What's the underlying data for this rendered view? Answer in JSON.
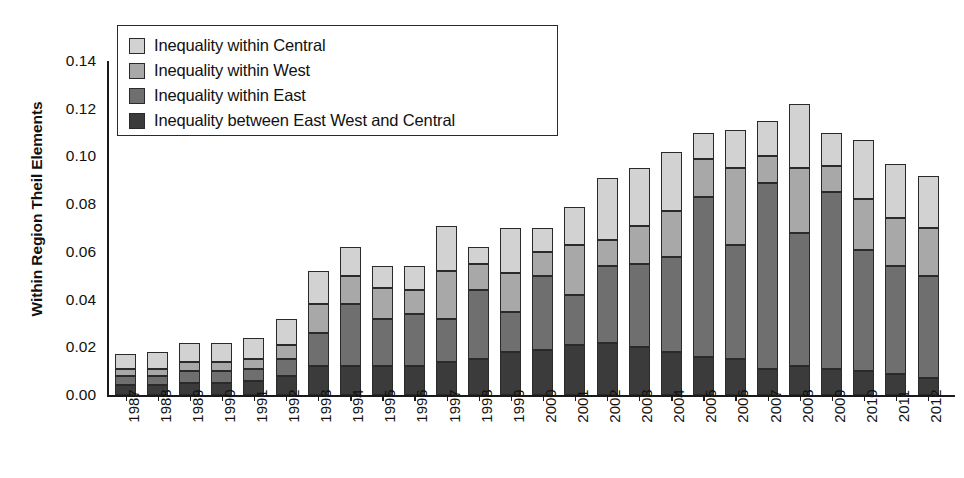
{
  "chart_data": {
    "type": "bar",
    "subtype": "stacked-bar",
    "title": "",
    "xlabel": "",
    "ylabel": "Within Region Theil Elements",
    "ylim": [
      0.0,
      0.14
    ],
    "ytick_labels": [
      "0.00",
      "0.02",
      "0.04",
      "0.06",
      "0.08",
      "0.10",
      "0.12",
      "0.14"
    ],
    "ytick_values": [
      0.0,
      0.02,
      0.04,
      0.06,
      0.08,
      0.1,
      0.12,
      0.14
    ],
    "grid": false,
    "legend_position": "top-left-inside",
    "stack_order_bottom_to_top": [
      "Inequality between East West and Central",
      "Inequality within East",
      "Inequality within West",
      "Inequality within Central"
    ],
    "categories": [
      "1987",
      "1988",
      "1989",
      "1990",
      "1991",
      "1992",
      "1993",
      "1994",
      "1995",
      "1996",
      "1997",
      "1998",
      "1999",
      "2000",
      "2001",
      "2002",
      "2003",
      "2004",
      "2005",
      "2006",
      "2007",
      "2008",
      "2009",
      "2010",
      "2011",
      "2012"
    ],
    "series": [
      {
        "name": "Inequality between East West and Central",
        "color": "#3b3b3b",
        "values": [
          0.004,
          0.004,
          0.005,
          0.005,
          0.006,
          0.008,
          0.012,
          0.012,
          0.012,
          0.012,
          0.014,
          0.015,
          0.018,
          0.019,
          0.021,
          0.022,
          0.02,
          0.018,
          0.016,
          0.015,
          0.011,
          0.012,
          0.011,
          0.01,
          0.009,
          0.007
        ]
      },
      {
        "name": "Inequality within East",
        "color": "#6f6f6f",
        "values": [
          0.004,
          0.004,
          0.005,
          0.005,
          0.005,
          0.007,
          0.014,
          0.026,
          0.02,
          0.022,
          0.018,
          0.029,
          0.017,
          0.031,
          0.021,
          0.032,
          0.035,
          0.04,
          0.067,
          0.048,
          0.078,
          0.056,
          0.074,
          0.051,
          0.045,
          0.043
        ]
      },
      {
        "name": "Inequality within West",
        "color": "#a8a8a8",
        "values": [
          0.003,
          0.003,
          0.004,
          0.004,
          0.004,
          0.006,
          0.012,
          0.012,
          0.013,
          0.01,
          0.02,
          0.011,
          0.016,
          0.01,
          0.021,
          0.011,
          0.016,
          0.019,
          0.016,
          0.032,
          0.011,
          0.027,
          0.011,
          0.021,
          0.02,
          0.02
        ]
      },
      {
        "name": "Inequality within Central",
        "color": "#d2d2d2",
        "values": [
          0.006,
          0.007,
          0.008,
          0.008,
          0.009,
          0.011,
          0.014,
          0.012,
          0.009,
          0.01,
          0.019,
          0.007,
          0.019,
          0.01,
          0.016,
          0.026,
          0.024,
          0.025,
          0.011,
          0.016,
          0.015,
          0.027,
          0.014,
          0.025,
          0.023,
          0.022
        ]
      }
    ],
    "totals": [
      0.017,
      0.018,
      0.022,
      0.022,
      0.024,
      0.032,
      0.052,
      0.062,
      0.054,
      0.054,
      0.071,
      0.062,
      0.07,
      0.07,
      0.079,
      0.091,
      0.095,
      0.102,
      0.11,
      0.111,
      0.115,
      0.122,
      0.11,
      0.107,
      0.097,
      0.092
    ],
    "annotations": []
  },
  "legend": {
    "items": [
      {
        "label": "Inequality within Central",
        "color": "#d2d2d2"
      },
      {
        "label": "Inequality within West",
        "color": "#a8a8a8"
      },
      {
        "label": "Inequality within East",
        "color": "#6f6f6f"
      },
      {
        "label": "Inequality between East West and Central",
        "color": "#3b3b3b"
      }
    ]
  },
  "colors": {
    "axis": "#1a1a1a",
    "background": "#ffffff",
    "segment_border": "#2a2a2a"
  }
}
